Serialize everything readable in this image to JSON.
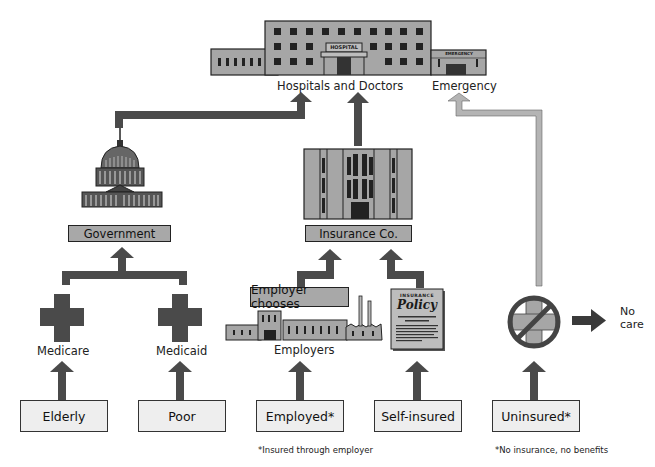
{
  "diagram": {
    "top": {
      "hospital_sign": "HOSPITAL",
      "emergency_sign": "EMERGENCY",
      "hospitals_label": "Hospitals and Doctors",
      "emergency_label": "Emergency"
    },
    "intermediaries": {
      "government_label": "Government",
      "insurance_label": "Insurance Co.",
      "employer_chooses_label": "Employer chooses",
      "employers_label": "Employers",
      "policy_title": "INSURANCE",
      "policy_word": "Policy"
    },
    "programs": {
      "medicare_label": "Medicare",
      "medicaid_label": "Medicaid"
    },
    "no_care_label_line1": "No",
    "no_care_label_line2": "care",
    "sources": [
      {
        "label": "Elderly"
      },
      {
        "label": "Poor"
      },
      {
        "label": "Employed*"
      },
      {
        "label": "Self-insured"
      },
      {
        "label": "Uninsured*"
      }
    ],
    "notes": {
      "employed_note": "*Insured through employer",
      "uninsured_note": "*No insurance, no benefits"
    },
    "colors": {
      "arrow_dark": "#4a4a4a",
      "arrow_light": "#b4b4b4",
      "building_fill": "#a6a6a6",
      "box_fill": "#a8a8a8",
      "source_fill": "#eeeeee"
    }
  }
}
